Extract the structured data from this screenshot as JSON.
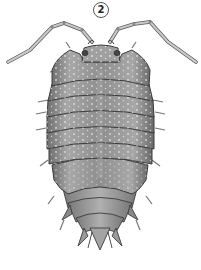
{
  "figure": {
    "label": "2",
    "colors": {
      "background": "#ffffff",
      "body_fill": "#9a9a9a",
      "body_light": "#c4c4c4",
      "body_dark": "#5e5e5e",
      "outline": "#3c3c3c",
      "spots": "#eaeaea",
      "antenna": "#b8b8b8"
    }
  }
}
